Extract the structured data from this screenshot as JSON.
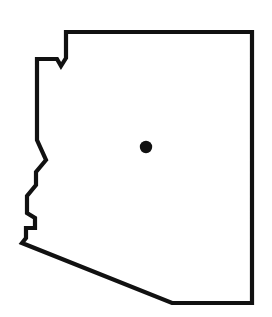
{
  "figure": {
    "kind": "state-outline-map",
    "title": "",
    "caption": "",
    "background_color": "#ffffff",
    "width": 272,
    "height": 317
  },
  "map": {
    "outline": {
      "name": "arizona-state-boundary",
      "stroke_color": "#111111",
      "fill_color": "#ffffff",
      "stroke_width": 4.2,
      "closed": true,
      "points": [
        [
          66,
          32
        ],
        [
          252,
          32
        ],
        [
          252,
          303
        ],
        [
          172,
          303
        ],
        [
          22,
          243
        ],
        [
          26,
          238
        ],
        [
          26,
          228
        ],
        [
          35,
          228
        ],
        [
          35,
          218
        ],
        [
          27,
          213
        ],
        [
          27,
          196
        ],
        [
          36,
          185
        ],
        [
          36,
          172
        ],
        [
          46,
          160
        ],
        [
          37,
          140
        ],
        [
          37,
          59
        ],
        [
          57,
          59
        ],
        [
          61,
          66
        ],
        [
          66,
          58
        ]
      ],
      "path_d": "M 66 32 L 252 32 L 252 303 L 172 303 L 22 243 L 26 238 L 26 228 L 35 228 L 35 218 L 27 213 L 27 196 L 36 185 L 36 172 L 46 160 L 37 140 L 37 59 L 57 59 L 61 66 L 66 58 Z"
    },
    "markers": [
      {
        "name": "capital-city-dot",
        "label": "",
        "shape": "circle",
        "cx": 146,
        "cy": 147,
        "r": 6.2,
        "color": "#111111"
      }
    ],
    "labels": []
  }
}
